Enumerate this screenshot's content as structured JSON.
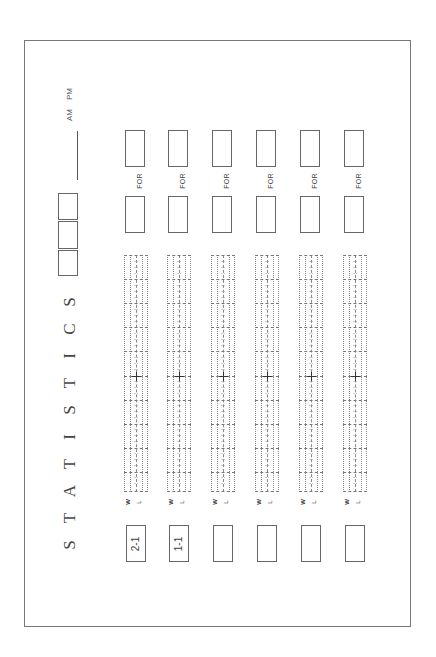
{
  "form": {
    "title_letters": [
      "S",
      "T",
      "A",
      "T",
      "I",
      "S",
      "T",
      "I",
      "C",
      "S"
    ],
    "title": "STATISTICS",
    "time_suffix": "AM  PM",
    "am_label": "AM",
    "pm_label": "PM"
  },
  "columns": [
    {
      "index": 1,
      "for_label": "FOR",
      "w_label": "W",
      "l_label": "L",
      "score": "2-1"
    },
    {
      "index": 2,
      "for_label": "FOR",
      "w_label": "W",
      "l_label": "L",
      "score": "1-1"
    },
    {
      "index": 3,
      "for_label": "FOR",
      "w_label": "W",
      "l_label": "L",
      "score": ""
    },
    {
      "index": 4,
      "for_label": "FOR",
      "w_label": "W",
      "l_label": "L",
      "score": ""
    },
    {
      "index": 5,
      "for_label": "FOR",
      "w_label": "W",
      "l_label": "L",
      "score": ""
    },
    {
      "index": 6,
      "for_label": "FOR",
      "w_label": "W",
      "l_label": "L",
      "score": ""
    }
  ],
  "colors": {
    "line": "#666666",
    "grid": "#888888",
    "text": "#444444"
  }
}
